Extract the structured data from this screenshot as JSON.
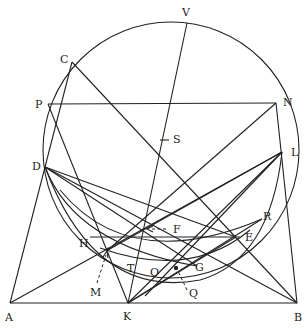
{
  "figure": {
    "type": "geometric construction",
    "stroke_color": "#222222",
    "background": "#ffffff",
    "circle": {
      "cx": 171,
      "cy": 150,
      "r": 128
    },
    "points": {
      "V": {
        "label": "V",
        "x": 187,
        "y": 23
      },
      "C": {
        "label": "C",
        "x": 72,
        "y": 62
      },
      "P": {
        "label": "P",
        "x": 48,
        "y": 104
      },
      "N": {
        "label": "N",
        "x": 276,
        "y": 103
      },
      "S": {
        "label": "S",
        "x": 164,
        "y": 140
      },
      "D": {
        "label": "D",
        "x": 45,
        "y": 167
      },
      "L": {
        "label": "L",
        "x": 282,
        "y": 152
      },
      "R": {
        "label": "R",
        "x": 260,
        "y": 221
      },
      "F": {
        "label": "F",
        "x": 148,
        "y": 229
      },
      "H": {
        "label": "H",
        "x": 106,
        "y": 237
      },
      "E": {
        "label": "E",
        "x": 236,
        "y": 237
      },
      "G": {
        "label": "G",
        "x": 197,
        "y": 266
      },
      "O": {
        "label": "O",
        "x": 163,
        "y": 272
      },
      "T": {
        "label": "T",
        "x": 137,
        "y": 263
      },
      "M": {
        "label": "M",
        "x": 108,
        "y": 250
      },
      "Q": {
        "label": "Q",
        "x": 176,
        "y": 268
      },
      "K": {
        "label": "K",
        "x": 128,
        "y": 303
      },
      "A": {
        "label": "A",
        "x": 10,
        "y": 303
      },
      "B": {
        "label": "B",
        "x": 297,
        "y": 303
      }
    },
    "labels": [
      "V",
      "C",
      "P",
      "N",
      "S",
      "D",
      "L",
      "R",
      "F",
      "H",
      "E",
      "G",
      "O",
      "T",
      "M",
      "Q",
      "K",
      "A",
      "B"
    ]
  }
}
